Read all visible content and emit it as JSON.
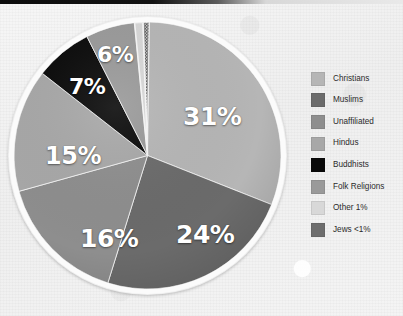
{
  "chart_data": {
    "type": "pie",
    "title": "",
    "legend_position": "right",
    "start_angle_deg": -2,
    "categories": [
      "Jews",
      "Christians",
      "Muslims",
      "Unaffiliated",
      "Hindus",
      "Buddhists",
      "Folk Religions",
      "Other"
    ],
    "values": [
      0.8,
      31,
      24,
      16,
      15,
      7,
      6,
      1
    ],
    "slice_labels": [
      "",
      "31%",
      "24%",
      "16%",
      "15%",
      "7%",
      "6%",
      ""
    ],
    "legend_labels": [
      "Christians",
      "Muslims",
      "Unaffiliated",
      "Hindus",
      "Buddhists",
      "Folk Religions",
      "Other 1%",
      "Jews <1%"
    ],
    "colors": [
      "#6e6e6e",
      "#b6b6b6",
      "#6b6b6b",
      "#8e8e8e",
      "#a8a8a8",
      "#0a0a0a",
      "#9a9a9a",
      "#d8d8d8"
    ],
    "legend_colors": [
      "#b6b6b6",
      "#6b6b6b",
      "#8e8e8e",
      "#a8a8a8",
      "#0a0a0a",
      "#9a9a9a",
      "#d8d8d8",
      "#6e6e6e"
    ]
  },
  "labels": {
    "christians_pct": "31%",
    "muslims_pct": "24%",
    "unaffiliated_pct": "16%",
    "hindus_pct": "15%",
    "buddhists_pct": "7%",
    "folk_pct": "6%"
  },
  "legend": {
    "items": [
      {
        "label": "Christians",
        "color": "#b6b6b6",
        "pattern": "solid"
      },
      {
        "label": "Muslims",
        "color": "#6b6b6b",
        "pattern": "solid"
      },
      {
        "label": "Unaffiliated",
        "color": "#8e8e8e",
        "pattern": "solid"
      },
      {
        "label": "Hindus",
        "color": "#a8a8a8",
        "pattern": "solid"
      },
      {
        "label": "Buddhists",
        "color": "#0a0a0a",
        "pattern": "solid"
      },
      {
        "label": "Folk Religions",
        "color": "#9a9a9a",
        "pattern": "solid"
      },
      {
        "label": "Other 1%",
        "color": "#d8d8d8",
        "pattern": "solid"
      },
      {
        "label": "Jews <1%",
        "color": "#6e6e6e",
        "pattern": "hatch"
      }
    ]
  },
  "theme": {
    "background": "#f2f2f2",
    "pie_ring": "#fbfbfb",
    "label_text": "#ffffff",
    "legend_text": "#2b2b2b",
    "top_bar": "#0d0d0d"
  }
}
